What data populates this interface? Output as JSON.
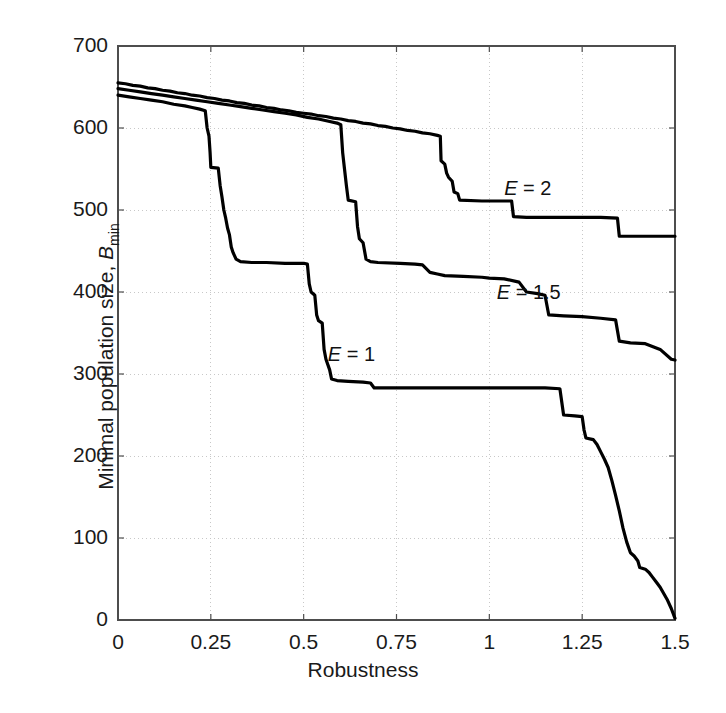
{
  "chart_data": {
    "type": "line",
    "title": "",
    "xlabel": "Robustness",
    "ylabel": "Minimal population size, B_min",
    "ylabel_main": "Minimal population size, ",
    "ylabel_sym": "B",
    "ylabel_sub": "min",
    "xlim": [
      0,
      1.5
    ],
    "ylim": [
      0,
      700
    ],
    "xticks": [
      0,
      0.25,
      0.5,
      0.75,
      1,
      1.25,
      1.5
    ],
    "xtick_labels": [
      "0",
      "0.25",
      "0.5",
      "0.75",
      "1",
      "1.25",
      "1.5"
    ],
    "yticks": [
      0,
      100,
      200,
      300,
      400,
      500,
      600,
      700
    ],
    "ytick_labels": [
      "0",
      "100",
      "200",
      "300",
      "400",
      "500",
      "600",
      "700"
    ],
    "grid": true,
    "grid_style": "dotted",
    "legend_position": "inline-annotations",
    "line_color": "#000000",
    "line_width": 3.2,
    "series": [
      {
        "name": "E = 2",
        "label": "E = 2",
        "label_prefix": "E",
        "label_suffix": " = 2",
        "annotation_x": 1.04,
        "annotation_y": 525,
        "points": [
          [
            0.0,
            655
          ],
          [
            0.02,
            654
          ],
          [
            0.04,
            652
          ],
          [
            0.06,
            651
          ],
          [
            0.08,
            649
          ],
          [
            0.1,
            648
          ],
          [
            0.12,
            646
          ],
          [
            0.14,
            645
          ],
          [
            0.16,
            643
          ],
          [
            0.18,
            642
          ],
          [
            0.2,
            640
          ],
          [
            0.22,
            639
          ],
          [
            0.24,
            637
          ],
          [
            0.26,
            636
          ],
          [
            0.28,
            634
          ],
          [
            0.3,
            633
          ],
          [
            0.32,
            631
          ],
          [
            0.34,
            630
          ],
          [
            0.36,
            628
          ],
          [
            0.38,
            627
          ],
          [
            0.4,
            625
          ],
          [
            0.42,
            624
          ],
          [
            0.44,
            622
          ],
          [
            0.46,
            621
          ],
          [
            0.48,
            619
          ],
          [
            0.5,
            618
          ],
          [
            0.52,
            617
          ],
          [
            0.54,
            615
          ],
          [
            0.56,
            614
          ],
          [
            0.58,
            612
          ],
          [
            0.6,
            611
          ],
          [
            0.62,
            609
          ],
          [
            0.64,
            608
          ],
          [
            0.66,
            606
          ],
          [
            0.68,
            605
          ],
          [
            0.7,
            603
          ],
          [
            0.72,
            602
          ],
          [
            0.74,
            600
          ],
          [
            0.76,
            599
          ],
          [
            0.78,
            597
          ],
          [
            0.8,
            596
          ],
          [
            0.82,
            594
          ],
          [
            0.84,
            593
          ],
          [
            0.86,
            591
          ],
          [
            0.868,
            590
          ],
          [
            0.87,
            560
          ],
          [
            0.88,
            556
          ],
          [
            0.885,
            545
          ],
          [
            0.89,
            540
          ],
          [
            0.9,
            535
          ],
          [
            0.905,
            522
          ],
          [
            0.915,
            520
          ],
          [
            0.92,
            512
          ],
          [
            0.98,
            511
          ],
          [
            1.06,
            511
          ],
          [
            1.065,
            492
          ],
          [
            1.1,
            491
          ],
          [
            1.2,
            491
          ],
          [
            1.3,
            491
          ],
          [
            1.345,
            490
          ],
          [
            1.35,
            468
          ],
          [
            1.4,
            468
          ],
          [
            1.45,
            468
          ],
          [
            1.5,
            468
          ]
        ]
      },
      {
        "name": "E = 1.5",
        "label": "E = 1.5",
        "label_prefix": "E",
        "label_suffix": " = 1.5",
        "annotation_x": 1.02,
        "annotation_y": 398,
        "points": [
          [
            0.0,
            648
          ],
          [
            0.03,
            646
          ],
          [
            0.06,
            644
          ],
          [
            0.09,
            642
          ],
          [
            0.12,
            640
          ],
          [
            0.15,
            638
          ],
          [
            0.18,
            636
          ],
          [
            0.21,
            634
          ],
          [
            0.24,
            632
          ],
          [
            0.27,
            630
          ],
          [
            0.3,
            628
          ],
          [
            0.33,
            626
          ],
          [
            0.36,
            624
          ],
          [
            0.39,
            622
          ],
          [
            0.42,
            620
          ],
          [
            0.45,
            618
          ],
          [
            0.48,
            616
          ],
          [
            0.51,
            613
          ],
          [
            0.54,
            611
          ],
          [
            0.57,
            608
          ],
          [
            0.59,
            606
          ],
          [
            0.6,
            604
          ],
          [
            0.605,
            570
          ],
          [
            0.61,
            550
          ],
          [
            0.615,
            530
          ],
          [
            0.62,
            512
          ],
          [
            0.64,
            510
          ],
          [
            0.645,
            480
          ],
          [
            0.65,
            465
          ],
          [
            0.66,
            460
          ],
          [
            0.668,
            440
          ],
          [
            0.68,
            437
          ],
          [
            0.7,
            436
          ],
          [
            0.76,
            435
          ],
          [
            0.8,
            434
          ],
          [
            0.82,
            433
          ],
          [
            0.84,
            424
          ],
          [
            0.86,
            422
          ],
          [
            0.88,
            420
          ],
          [
            0.93,
            419
          ],
          [
            0.98,
            418
          ],
          [
            1.0,
            417
          ],
          [
            1.04,
            416
          ],
          [
            1.08,
            412
          ],
          [
            1.1,
            400
          ],
          [
            1.13,
            398
          ],
          [
            1.15,
            396
          ],
          [
            1.16,
            372
          ],
          [
            1.2,
            371
          ],
          [
            1.25,
            370
          ],
          [
            1.3,
            368
          ],
          [
            1.34,
            366
          ],
          [
            1.35,
            340
          ],
          [
            1.38,
            338
          ],
          [
            1.42,
            337
          ],
          [
            1.46,
            330
          ],
          [
            1.49,
            318
          ],
          [
            1.5,
            317
          ]
        ]
      },
      {
        "name": "E = 1",
        "label": "E = 1",
        "label_prefix": "E",
        "label_suffix": " = 1",
        "annotation_x": 0.565,
        "annotation_y": 322,
        "points": [
          [
            0.0,
            640
          ],
          [
            0.03,
            638
          ],
          [
            0.06,
            636
          ],
          [
            0.09,
            634
          ],
          [
            0.12,
            632
          ],
          [
            0.15,
            629
          ],
          [
            0.18,
            627
          ],
          [
            0.2,
            625
          ],
          [
            0.22,
            623
          ],
          [
            0.235,
            621
          ],
          [
            0.24,
            600
          ],
          [
            0.245,
            590
          ],
          [
            0.248,
            570
          ],
          [
            0.25,
            552
          ],
          [
            0.27,
            551
          ],
          [
            0.275,
            530
          ],
          [
            0.28,
            516
          ],
          [
            0.285,
            500
          ],
          [
            0.29,
            490
          ],
          [
            0.295,
            478
          ],
          [
            0.3,
            470
          ],
          [
            0.305,
            455
          ],
          [
            0.31,
            448
          ],
          [
            0.318,
            440
          ],
          [
            0.33,
            437
          ],
          [
            0.36,
            436
          ],
          [
            0.4,
            436
          ],
          [
            0.45,
            435
          ],
          [
            0.5,
            435
          ],
          [
            0.51,
            434
          ],
          [
            0.515,
            410
          ],
          [
            0.52,
            400
          ],
          [
            0.53,
            396
          ],
          [
            0.535,
            372
          ],
          [
            0.54,
            365
          ],
          [
            0.55,
            362
          ],
          [
            0.555,
            330
          ],
          [
            0.56,
            318
          ],
          [
            0.57,
            305
          ],
          [
            0.575,
            294
          ],
          [
            0.59,
            292
          ],
          [
            0.62,
            291
          ],
          [
            0.66,
            290
          ],
          [
            0.68,
            289
          ],
          [
            0.69,
            283
          ],
          [
            0.75,
            283
          ],
          [
            0.85,
            283
          ],
          [
            0.95,
            283
          ],
          [
            1.05,
            283
          ],
          [
            1.15,
            283
          ],
          [
            1.19,
            282
          ],
          [
            1.2,
            250
          ],
          [
            1.23,
            249
          ],
          [
            1.25,
            248
          ],
          [
            1.255,
            232
          ],
          [
            1.26,
            222
          ],
          [
            1.28,
            220
          ],
          [
            1.29,
            214
          ],
          [
            1.3,
            205
          ],
          [
            1.31,
            196
          ],
          [
            1.32,
            186
          ],
          [
            1.33,
            170
          ],
          [
            1.34,
            152
          ],
          [
            1.35,
            133
          ],
          [
            1.36,
            112
          ],
          [
            1.37,
            95
          ],
          [
            1.38,
            82
          ],
          [
            1.39,
            78
          ],
          [
            1.4,
            72
          ],
          [
            1.405,
            64
          ],
          [
            1.42,
            62
          ],
          [
            1.43,
            58
          ],
          [
            1.44,
            52
          ],
          [
            1.45,
            46
          ],
          [
            1.46,
            40
          ],
          [
            1.47,
            32
          ],
          [
            1.48,
            24
          ],
          [
            1.49,
            14
          ],
          [
            1.5,
            2
          ]
        ]
      }
    ]
  },
  "figure": {
    "background": "#ffffff",
    "axis_color": "#4d4d4d",
    "grid_color": "#c8c8c8",
    "text_color": "#1a1a1a"
  }
}
